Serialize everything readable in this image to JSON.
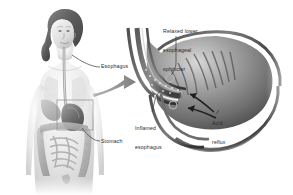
{
  "figure": {
    "style": "grayscale medical illustration",
    "background_color": "#ffffff",
    "text_color": "#2b2b2b",
    "width": 293,
    "height": 195
  },
  "labels": {
    "relaxed_sphincter": {
      "line1": "Relaxed lower",
      "line2": "esophageal",
      "line3": "sphincter"
    },
    "esophagus": "Esophagus",
    "stomach": "Stomach",
    "inflamed_esophagus": {
      "line1": "Inflamed",
      "line2": "esophagus"
    },
    "acid_reflux": {
      "line1": "Acid",
      "line2": "reflux"
    }
  },
  "panels": {
    "body_figure": {
      "name": "female torso with digestive anatomy",
      "parts": [
        "head",
        "hair",
        "neck",
        "shoulders",
        "torso",
        "esophagus",
        "lungs",
        "stomach",
        "liver",
        "large-intestine",
        "small-intestine"
      ]
    },
    "magnified_view": {
      "name": "cross-section of gastroesophageal junction",
      "parts": [
        "esophagus-lumen",
        "lower-esophageal-sphincter",
        "stomach-body",
        "gastric-rugae",
        "reflux-arrows"
      ]
    }
  },
  "connectors": {
    "magnify_arrow": "thick gray arrow pointing right from callout box to magnified view",
    "callout_box": "thin rectangle outlining the stomach region on the torso"
  },
  "colors": {
    "ink": "#2b2b2b",
    "mid_gray": "#8d8d8d",
    "light_gray": "#d2d2d2",
    "dark_gray": "#4a4a4a",
    "arrow_gray": "#9a9a9a"
  }
}
